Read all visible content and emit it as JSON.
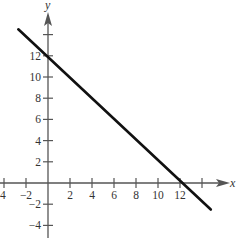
{
  "chart_data": {
    "type": "line",
    "title": "",
    "xlabel": "x",
    "ylabel": "y",
    "xlim": [
      -4,
      15
    ],
    "ylim": [
      -5,
      16
    ],
    "grid": false,
    "x_ticks": [
      -4,
      -2,
      2,
      4,
      6,
      8,
      10,
      12,
      14
    ],
    "x_tick_labels": [
      "4",
      "−2",
      "2",
      "4",
      "6",
      "8",
      "10",
      "12",
      ""
    ],
    "y_ticks": [
      -4,
      -2,
      2,
      4,
      6,
      8,
      10,
      12,
      14
    ],
    "y_tick_labels": [
      "−4",
      "−2",
      "2",
      "4",
      "6",
      "8",
      "10",
      "12",
      ""
    ],
    "series": [
      {
        "name": "line",
        "x": [
          -2.7,
          14.8
        ],
        "y": [
          14.5,
          -2.5
        ],
        "equation": "y = 12 - x",
        "x_intercept": 12,
        "y_intercept": 12
      }
    ]
  },
  "colors": {
    "axis": "#555555",
    "line": "#111111",
    "text": "#333333"
  }
}
